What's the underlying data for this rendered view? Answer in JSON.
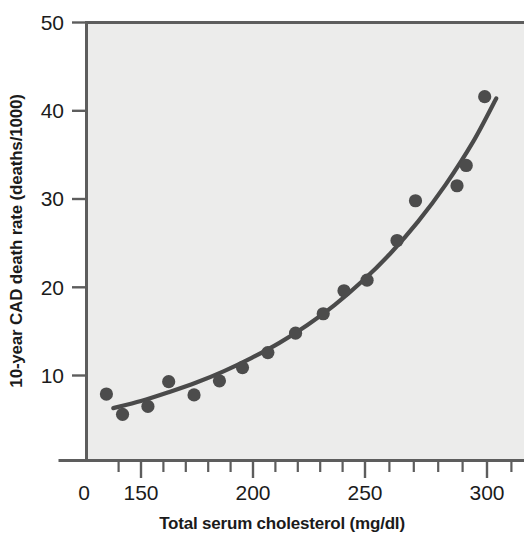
{
  "chart_data": {
    "type": "scatter",
    "title": "",
    "subtitle": "",
    "xlabel": "Total serum cholesterol (mg/dl)",
    "ylabel": "10-year CAD death rate (deaths/1000)",
    "xlim": [
      120,
      310
    ],
    "ylim": [
      0,
      50
    ],
    "x_tick_labels": [
      "0",
      "150",
      "200",
      "250",
      "300"
    ],
    "x_ticks": [
      0,
      150,
      200,
      250,
      300
    ],
    "x_minor_tick_step": 10,
    "y_tick_labels": [
      "10",
      "20",
      "30",
      "40",
      "50"
    ],
    "y_ticks": [
      10,
      20,
      30,
      40,
      50
    ],
    "grid": false,
    "legend": false,
    "legend_position": "none",
    "point_color": "#4c4c4c",
    "curve_color": "#4a4a4a",
    "plot_background": "#ececeb",
    "axis_color": "#5d5d5d",
    "series": [
      {
        "name": "10-year CAD death rate",
        "marker": "filled-circle",
        "x": [
          135,
          142,
          153,
          162,
          173,
          184,
          194,
          205,
          217,
          229,
          238,
          248,
          261,
          269,
          287,
          291,
          299
        ],
        "y": [
          7.9,
          5.6,
          6.5,
          9.3,
          7.8,
          9.4,
          10.9,
          12.6,
          14.8,
          17.0,
          19.6,
          20.8,
          25.3,
          29.8,
          31.5,
          33.8,
          41.6
        ]
      },
      {
        "name": "fitted curve",
        "type": "line",
        "x": [
          138,
          150,
          162,
          174,
          186,
          198,
          210,
          222,
          234,
          246,
          258,
          270,
          282,
          294,
          304
        ],
        "y": [
          6.3,
          7.1,
          8.1,
          9.2,
          10.5,
          12.0,
          13.7,
          15.7,
          18.0,
          20.7,
          23.8,
          27.4,
          31.6,
          36.5,
          41.4
        ]
      }
    ]
  },
  "axes": {
    "x_axis_label": "Total serum cholesterol (mg/dl)",
    "y_axis_label": "10-year CAD death rate (deaths/1000)",
    "x_tick_0": "0",
    "x_tick_150": "150",
    "x_tick_200": "200",
    "x_tick_250": "250",
    "x_tick_300": "300",
    "y_tick_10": "10",
    "y_tick_20": "20",
    "y_tick_30": "30",
    "y_tick_40": "40",
    "y_tick_50": "50"
  }
}
